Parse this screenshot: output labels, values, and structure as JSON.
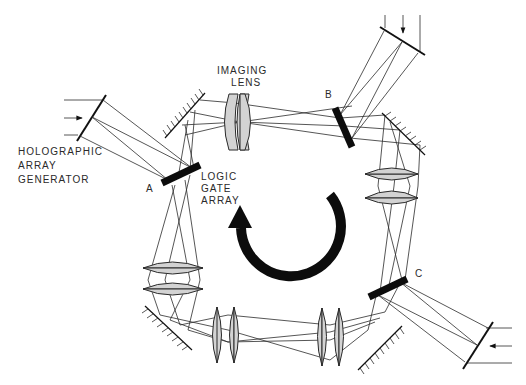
{
  "diagram": {
    "type": "optical-loop-schematic",
    "labels": {
      "imaging_lens": [
        "IMAGING",
        "LENS"
      ],
      "holographic_array_generator": [
        "HOLOGRAPHIC",
        "ARRAY",
        "GENERATOR"
      ],
      "logic_gate_array": [
        "LOGIC",
        "GATE",
        "ARRAY"
      ],
      "node_a": "A",
      "node_b": "B",
      "node_c": "C"
    },
    "components": [
      {
        "id": "hag-left",
        "kind": "holographic-array-generator",
        "attached_to": "A"
      },
      {
        "id": "hag-top",
        "kind": "holographic-array-generator",
        "attached_to": "B"
      },
      {
        "id": "hag-right",
        "kind": "holographic-array-generator",
        "attached_to": "C"
      },
      {
        "id": "gate-a",
        "kind": "logic-gate-array",
        "label": "A"
      },
      {
        "id": "gate-b",
        "kind": "logic-gate-array",
        "label": "B"
      },
      {
        "id": "gate-c",
        "kind": "logic-gate-array",
        "label": "C"
      },
      {
        "id": "lens-top",
        "kind": "imaging-lens"
      },
      {
        "id": "lens-right",
        "kind": "imaging-lens"
      },
      {
        "id": "lens-left",
        "kind": "imaging-lens"
      },
      {
        "id": "lens-bottom-1",
        "kind": "imaging-lens"
      },
      {
        "id": "lens-bottom-2",
        "kind": "imaging-lens"
      },
      {
        "id": "mirror-top-left",
        "kind": "mirror"
      },
      {
        "id": "mirror-top-right",
        "kind": "mirror"
      },
      {
        "id": "mirror-bottom-left",
        "kind": "mirror"
      },
      {
        "id": "mirror-bottom-right",
        "kind": "mirror"
      }
    ],
    "flow_direction": "counter-clockwise",
    "colors": {
      "line": "#2b2b2b",
      "lens_fill": "#d3d3d3",
      "gate": "#0c0c0c",
      "background": "#ffffff"
    }
  }
}
